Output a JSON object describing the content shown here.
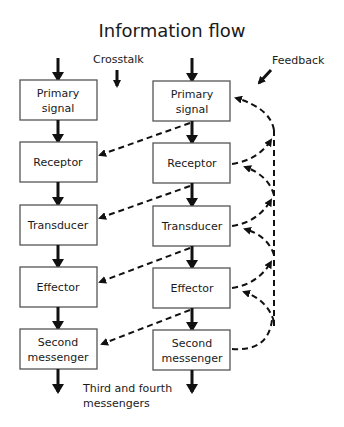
{
  "title": "Information flow",
  "annotations": {
    "crosstalk": "Crosstalk",
    "feedback": "Feedback",
    "output_line1": "Third and fourth",
    "output_line2": "messengers"
  },
  "left_column": {
    "boxes": [
      {
        "line1": "Primary",
        "line2": "signal"
      },
      {
        "line1": "Receptor",
        "line2": ""
      },
      {
        "line1": "Transducer",
        "line2": ""
      },
      {
        "line1": "Effector",
        "line2": ""
      },
      {
        "line1": "Second",
        "line2": "messenger"
      }
    ]
  },
  "right_column": {
    "boxes": [
      {
        "line1": "Primary",
        "line2": "signal"
      },
      {
        "line1": "Receptor",
        "line2": ""
      },
      {
        "line1": "Transducer",
        "line2": ""
      },
      {
        "line1": "Effector",
        "line2": ""
      },
      {
        "line1": "Second",
        "line2": "messenger"
      }
    ]
  },
  "edges": {
    "solid": "vertical information flow between stages",
    "crosstalk_dashed": "right column stage outputs to next left column stage",
    "feedback_dashed": "right column stage outputs loop back to earlier right column stages"
  }
}
